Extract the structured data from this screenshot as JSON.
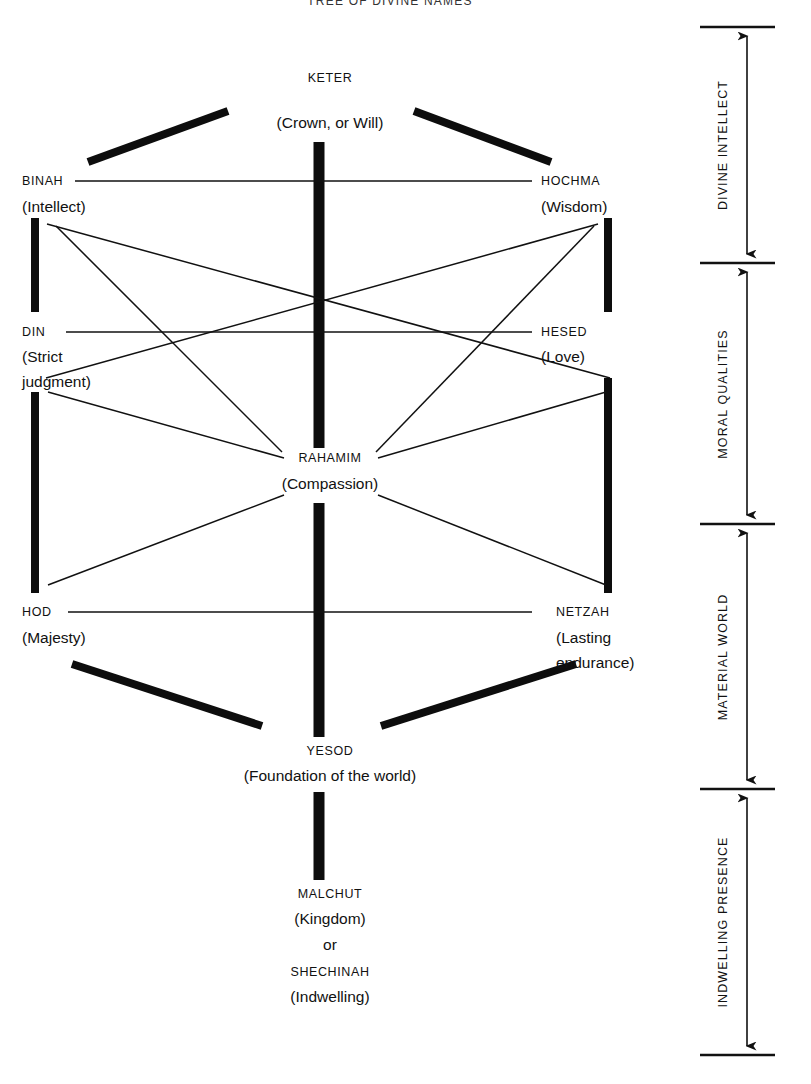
{
  "title": "TREE OF DIVINE NAMES",
  "diagram": {
    "type": "kabbalah-tree-of-life",
    "width": 811,
    "height": 1084,
    "sefirot": [
      {
        "id": "keter",
        "name": "KETER",
        "gloss": [
          "(Crown, or Will)"
        ],
        "x": 330,
        "y": 78,
        "pillar": "center"
      },
      {
        "id": "binah",
        "name": "BINAH",
        "gloss": [
          "(Intellect)"
        ],
        "x": 22,
        "y": 180,
        "pillar": "left"
      },
      {
        "id": "hochma",
        "name": "HOCHMA",
        "gloss": [
          "(Wisdom)"
        ],
        "x": 541,
        "y": 180,
        "pillar": "right"
      },
      {
        "id": "din",
        "name": "DIN",
        "gloss": [
          "(Strict",
          "judgment)"
        ],
        "x": 22,
        "y": 331,
        "pillar": "left"
      },
      {
        "id": "hesed",
        "name": "HESED",
        "gloss": [
          "(Love)"
        ],
        "x": 541,
        "y": 331,
        "pillar": "right"
      },
      {
        "id": "rahamim",
        "name": "RAHAMIM",
        "gloss": [
          "(Compassion)"
        ],
        "x": 330,
        "y": 458,
        "pillar": "center"
      },
      {
        "id": "hod",
        "name": "HOD",
        "gloss": [
          "(Majesty)"
        ],
        "x": 22,
        "y": 611,
        "pillar": "left"
      },
      {
        "id": "netzah",
        "name": "NETZAH",
        "gloss": [
          "(Lasting",
          "endurance)"
        ],
        "x": 541,
        "y": 611,
        "pillar": "right"
      },
      {
        "id": "yesod",
        "name": "YESOD",
        "gloss": [
          "(Foundation of the world)"
        ],
        "x": 330,
        "y": 750,
        "pillar": "center"
      },
      {
        "id": "malchut",
        "name": "MALCHUT",
        "gloss": [
          "(Kingdom)",
          "or",
          "SHECHINAH",
          "(Indwelling)"
        ],
        "x": 330,
        "y": 895,
        "pillar": "center"
      }
    ],
    "brackets": [
      {
        "id": "divine-intellect",
        "label": "DIVINE INTELLECT",
        "top": 27,
        "bottom": 263
      },
      {
        "id": "moral-qualities",
        "label": "MORAL QUALITIES",
        "top": 263,
        "bottom": 524
      },
      {
        "id": "material-world",
        "label": "MATERIAL WORLD",
        "top": 524,
        "bottom": 789
      },
      {
        "id": "indwelling-presence",
        "label": "INDWELLING PRESENCE",
        "top": 789,
        "bottom": 1055
      }
    ],
    "colors": {
      "ink": "#0d0d0d",
      "background": "#ffffff"
    }
  }
}
